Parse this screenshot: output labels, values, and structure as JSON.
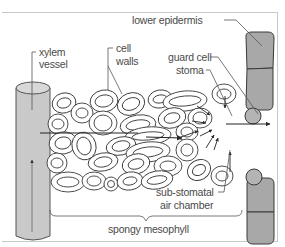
{
  "diagram": {
    "labels": {
      "xylem_vessel_line1": "xylem",
      "xylem_vessel_line2": "vessel",
      "cell_walls_line1": "cell",
      "cell_walls_line2": "walls",
      "lower_epidermis": "lower epidermis",
      "guard_cell": "guard cell",
      "stoma": "stoma",
      "sub_stomatal_line1": "sub-stomatal",
      "sub_stomatal_line2": "air chamber",
      "spongy_mesophyll": "spongy mesophyll"
    },
    "colors": {
      "frame": "#c8c8c8",
      "line": "#3a3a3a",
      "epidermis_fill": "#a8a8a8",
      "xylem_fill": "#c9c9c9",
      "guard_cell_fill": "#b4b4b4",
      "text": "#4a4a4a"
    },
    "icons": {
      "flow_arrow": "arrow-right-icon",
      "diffusion_arrows": "arrow-converge-icon"
    }
  }
}
